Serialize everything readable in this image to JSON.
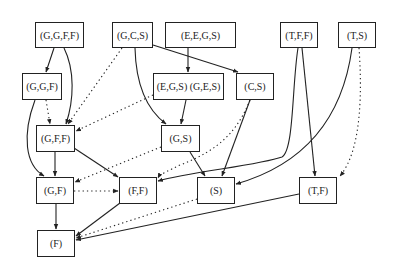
{
  "diagram": {
    "type": "directed-graph",
    "nodes": [
      {
        "id": "GGFF",
        "label": "(G,G,F,F)",
        "x": 35,
        "y": 22,
        "w": 49,
        "h": 26
      },
      {
        "id": "GCS",
        "label": "(G,C,S)",
        "x": 112,
        "y": 22,
        "w": 41,
        "h": 26
      },
      {
        "id": "EEGS",
        "label": "(E,E,G,S)",
        "x": 165,
        "y": 22,
        "w": 71,
        "h": 26
      },
      {
        "id": "TFF",
        "label": "(T,F,F)",
        "x": 280,
        "y": 22,
        "w": 38,
        "h": 26
      },
      {
        "id": "TS",
        "label": "(T,S)",
        "x": 338,
        "y": 22,
        "w": 38,
        "h": 26
      },
      {
        "id": "GGF",
        "label": "(G,G,F)",
        "x": 22,
        "y": 73,
        "w": 40,
        "h": 27
      },
      {
        "id": "EGS",
        "label": "(E,G,S) (G,E,S)",
        "x": 153,
        "y": 73,
        "w": 71,
        "h": 27
      },
      {
        "id": "CS",
        "label": "(C,S)",
        "x": 236,
        "y": 73,
        "w": 38,
        "h": 27
      },
      {
        "id": "GFF",
        "label": "(G,F,F)",
        "x": 36,
        "y": 125,
        "w": 39,
        "h": 27
      },
      {
        "id": "GS",
        "label": "(G,S)",
        "x": 161,
        "y": 125,
        "w": 39,
        "h": 27
      },
      {
        "id": "GF",
        "label": "(G,F)",
        "x": 36,
        "y": 177,
        "w": 38,
        "h": 27
      },
      {
        "id": "FF",
        "label": "(F,F)",
        "x": 119,
        "y": 177,
        "w": 38,
        "h": 27
      },
      {
        "id": "S",
        "label": "(S)",
        "x": 197,
        "y": 177,
        "w": 38,
        "h": 27
      },
      {
        "id": "TF",
        "label": "(T,F)",
        "x": 299,
        "y": 177,
        "w": 38,
        "h": 27
      },
      {
        "id": "F",
        "label": "(F)",
        "x": 37,
        "y": 230,
        "w": 38,
        "h": 27
      }
    ],
    "edges": [
      {
        "from": "GGFF",
        "to": "GGF",
        "style": "solid"
      },
      {
        "from": "GGFF",
        "to": "GFF",
        "style": "solid"
      },
      {
        "from": "GCS",
        "to": "GFF",
        "style": "dotted"
      },
      {
        "from": "GCS",
        "to": "GS",
        "style": "solid"
      },
      {
        "from": "GCS",
        "to": "CS",
        "style": "solid"
      },
      {
        "from": "EEGS",
        "to": "EGS",
        "style": "solid"
      },
      {
        "from": "EGS",
        "to": "GS",
        "style": "solid"
      },
      {
        "from": "EGS",
        "to": "GFF",
        "style": "dotted"
      },
      {
        "from": "GGF",
        "to": "GFF",
        "style": "dotted"
      },
      {
        "from": "GGF",
        "to": "GF",
        "style": "solid"
      },
      {
        "from": "CS",
        "to": "S",
        "style": "solid"
      },
      {
        "from": "CS",
        "to": "FF",
        "style": "dotted"
      },
      {
        "from": "TFF",
        "to": "FF",
        "style": "solid"
      },
      {
        "from": "TFF",
        "to": "TF",
        "style": "solid"
      },
      {
        "from": "TS",
        "to": "S",
        "style": "solid"
      },
      {
        "from": "TS",
        "to": "TF",
        "style": "dotted"
      },
      {
        "from": "GFF",
        "to": "GF",
        "style": "solid"
      },
      {
        "from": "GFF",
        "to": "FF",
        "style": "solid"
      },
      {
        "from": "GS",
        "to": "S",
        "style": "solid"
      },
      {
        "from": "GS",
        "to": "GF",
        "style": "dotted"
      },
      {
        "from": "GF",
        "to": "FF",
        "style": "dotted"
      },
      {
        "from": "GF",
        "to": "F",
        "style": "solid"
      },
      {
        "from": "FF",
        "to": "F",
        "style": "solid"
      },
      {
        "from": "S",
        "to": "F",
        "style": "dotted"
      },
      {
        "from": "TF",
        "to": "F",
        "style": "solid"
      }
    ]
  },
  "labels": {
    "GGFF": "(G,G,F,F)",
    "GCS": "(G,C,S)",
    "EEGS": "(E,E,G,S)",
    "TFF": "(T,F,F)",
    "TS": "(T,S)",
    "GGF": "(G,G,F)",
    "EGS": "(E,G,S) (G,E,S)",
    "CS": "(C,S)",
    "GFF": "(G,F,F)",
    "GS": "(G,S)",
    "GF": "(G,F)",
    "FF": "(F,F)",
    "S": "(S)",
    "TF": "(T,F)",
    "F": "(F)"
  }
}
